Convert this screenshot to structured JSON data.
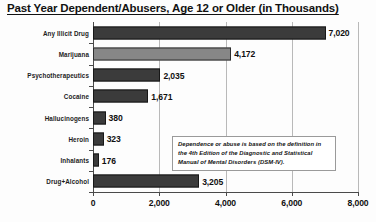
{
  "chart_data": {
    "type": "bar",
    "orientation": "horizontal",
    "title": "Past Year Dependent/Abusers, Age 12 or Older (in Thousands)",
    "xlabel": "",
    "ylabel": "",
    "xlim": [
      0,
      8000
    ],
    "grid": true,
    "legend": null,
    "categories": [
      "Any Illicit Drug",
      "Marijuana",
      "Psychotherapeutics",
      "Cocaine",
      "Hallucinogens",
      "Heroin",
      "Inhalants",
      "Drug+Alcohol"
    ],
    "values": [
      7020,
      4172,
      2035,
      1671,
      380,
      323,
      176,
      3205
    ],
    "value_labels": [
      "7,020",
      "4,172",
      "2,035",
      "1,671",
      "380",
      "323",
      "176",
      "3,205"
    ],
    "bar_colors": [
      "#3b3b3b",
      "#878787",
      "#3b3b3b",
      "#3b3b3b",
      "#3b3b3b",
      "#3b3b3b",
      "#3b3b3b",
      "#3b3b3b"
    ],
    "xticks": [
      0,
      2000,
      4000,
      6000,
      8000
    ],
    "xtick_labels": [
      "0",
      "2,000",
      "4,000",
      "6,000",
      "8,000"
    ],
    "annotation": "Dependence or abuse is based on the definition in the 4th Edition of the Diagnostic and Statistical Manual of Mental Disorders (DSM-IV)."
  }
}
